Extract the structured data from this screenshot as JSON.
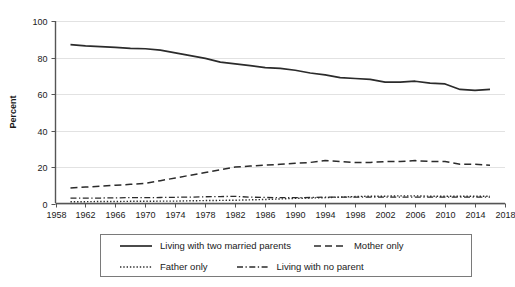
{
  "chart_data": {
    "type": "line",
    "title": "",
    "xlabel": "",
    "ylabel": "Percent",
    "xlim": [
      1958,
      2018
    ],
    "ylim": [
      0,
      100
    ],
    "grid": true,
    "legend_position": "bottom",
    "x_ticks": [
      1958,
      1962,
      1966,
      1970,
      1974,
      1978,
      1982,
      1986,
      1990,
      1994,
      1998,
      2002,
      2006,
      2010,
      2014,
      2018
    ],
    "y_ticks": [
      0,
      20,
      40,
      60,
      80,
      100
    ],
    "x": [
      1960,
      1962,
      1964,
      1966,
      1968,
      1970,
      1972,
      1974,
      1976,
      1978,
      1980,
      1982,
      1984,
      1986,
      1988,
      1990,
      1992,
      1994,
      1996,
      1998,
      2000,
      2002,
      2004,
      2006,
      2008,
      2010,
      2012,
      2014,
      2016
    ],
    "series": [
      {
        "name": "Living with two married parents",
        "style": "solid",
        "values": [
          87.0,
          86.4,
          86.0,
          85.5,
          85.0,
          84.8,
          84.0,
          82.5,
          81.0,
          79.5,
          77.5,
          76.5,
          75.5,
          74.5,
          74.0,
          73.0,
          71.5,
          70.5,
          69.0,
          68.5,
          68.0,
          66.5,
          66.5,
          67.0,
          66.0,
          65.5,
          62.5,
          62.0,
          62.5
        ]
      },
      {
        "name": "Mother only",
        "style": "dashed",
        "values": [
          8.5,
          9.0,
          9.5,
          10.0,
          10.5,
          11.0,
          12.5,
          14.0,
          15.5,
          17.0,
          18.5,
          20.0,
          20.5,
          21.0,
          21.5,
          22.0,
          22.5,
          23.5,
          23.0,
          22.5,
          22.5,
          23.0,
          23.0,
          23.5,
          23.0,
          23.0,
          21.5,
          21.5,
          21.0
        ]
      },
      {
        "name": "Father only",
        "style": "dotted",
        "values": [
          1.0,
          1.0,
          1.1,
          1.1,
          1.2,
          1.2,
          1.3,
          1.3,
          1.5,
          1.6,
          1.7,
          1.8,
          2.0,
          2.2,
          2.5,
          2.8,
          3.0,
          3.2,
          3.5,
          3.8,
          4.0,
          4.0,
          4.2,
          4.2,
          4.0,
          4.0,
          4.0,
          4.0,
          4.0
        ]
      },
      {
        "name": "Living with no parent",
        "style": "dashdot",
        "values": [
          3.0,
          3.0,
          3.0,
          3.1,
          3.2,
          3.2,
          3.3,
          3.4,
          3.5,
          3.7,
          3.8,
          3.9,
          3.5,
          3.3,
          3.2,
          3.2,
          3.3,
          3.5,
          3.5,
          3.5,
          3.5,
          3.5,
          3.5,
          3.5,
          3.5,
          3.5,
          3.5,
          3.5,
          3.5
        ]
      }
    ]
  },
  "legend": {
    "rows": [
      [
        {
          "label": "Living with two married parents",
          "style": "solid"
        },
        {
          "label": "Mother only",
          "style": "dashed"
        }
      ],
      [
        {
          "label": "Father only",
          "style": "dotted"
        },
        {
          "label": "Living with no parent",
          "style": "dashdot"
        }
      ]
    ]
  },
  "colors": {
    "line": "#2b2b2b",
    "grid": "#e2e2e2",
    "axis": "#555555",
    "legend_border": "#7a7a7a",
    "background": "#ffffff"
  }
}
